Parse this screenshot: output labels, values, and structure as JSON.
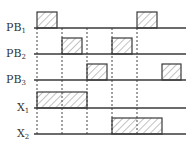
{
  "diagram": {
    "type": "timing-diagram",
    "signals": [
      {
        "name": "PB",
        "sub": "1",
        "baseline_y": 28,
        "pulses": [
          [
            37,
            57
          ],
          [
            137,
            157
          ]
        ]
      },
      {
        "name": "PB",
        "sub": "2",
        "baseline_y": 54,
        "pulses": [
          [
            62,
            82
          ],
          [
            112,
            132
          ]
        ]
      },
      {
        "name": "PB",
        "sub": "3",
        "baseline_y": 80,
        "pulses": [
          [
            87,
            107
          ],
          [
            162,
            181
          ]
        ]
      },
      {
        "name": "X",
        "sub": "1",
        "baseline_y": 108,
        "pulses": [
          [
            37,
            87
          ]
        ]
      },
      {
        "name": "X",
        "sub": "2",
        "baseline_y": 134,
        "pulses": [
          [
            112,
            162
          ]
        ]
      }
    ],
    "pulse_height": 16,
    "baseline_x_start": 34,
    "baseline_x_end": 186,
    "dashed_guides_x": [
      37,
      62,
      87,
      112,
      137
    ],
    "dashed_y_start": 28,
    "dashed_y_end": 136,
    "colors": {
      "line": "#3a3a3a",
      "hatch": "#555555",
      "dashed": "#444444"
    }
  }
}
